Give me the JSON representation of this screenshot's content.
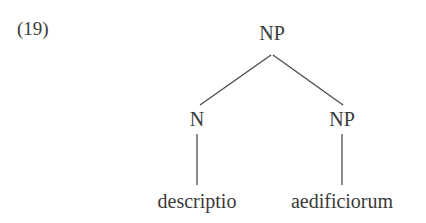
{
  "example": {
    "number_label": "(19)"
  },
  "tree": {
    "root": {
      "label": "NP"
    },
    "children": [
      {
        "label": "N",
        "leaf": "descriptio"
      },
      {
        "label": "NP",
        "leaf": "aedificiorum"
      }
    ]
  },
  "style": {
    "background": "#ffffff",
    "ink": "#3a3a3a",
    "line_color": "#4a4a4a"
  }
}
